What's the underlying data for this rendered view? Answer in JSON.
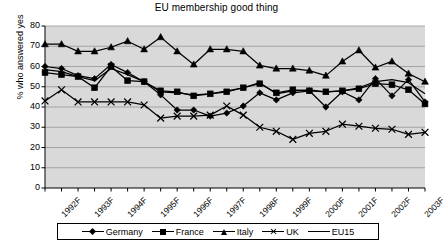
{
  "chart_data": {
    "type": "line",
    "title": "EU membership good thing",
    "xlabel": "",
    "ylabel": "% who answered yes",
    "ylim": [
      0,
      80
    ],
    "ytick_step": 10,
    "yticks": [
      0,
      10,
      20,
      30,
      40,
      50,
      60,
      70,
      80
    ],
    "grid": true,
    "legend_position": "bottom",
    "plot_background": "#d9d9d9",
    "x_tick_labels": [
      "1992F",
      "1993F",
      "1994F",
      "1995F",
      "1996F",
      "1997F",
      "1998F",
      "1999F",
      "2000F",
      "2001F",
      "2002F",
      "2003F"
    ],
    "x_points": 24,
    "x_note": "semi-annual survey waves, labels shown at every second point",
    "series": [
      {
        "name": "Germany",
        "marker": "diamond",
        "color": "#000000",
        "values": [
          60,
          59,
          55.5,
          54,
          61,
          57,
          52.5,
          46,
          38.5,
          38.5,
          35.5,
          37,
          40.5,
          47,
          43.5,
          47,
          48,
          40,
          47.5,
          43.5,
          54,
          45.5,
          53.5,
          42.5
        ]
      },
      {
        "name": "France",
        "marker": "square",
        "color": "#000000",
        "values": [
          57,
          56,
          55,
          49.5,
          60,
          53,
          52.5,
          48,
          47.5,
          45.5,
          46.5,
          47.5,
          49.5,
          51.5,
          47,
          48.5,
          48,
          47.5,
          48,
          49,
          51.5,
          51,
          48.5,
          41.5
        ]
      },
      {
        "name": "Italy",
        "marker": "triangle",
        "color": "#000000",
        "values": [
          71,
          71,
          67.5,
          67.5,
          69.5,
          72.5,
          68.5,
          74.5,
          67.5,
          61,
          68.5,
          68.5,
          67.5,
          60.5,
          59,
          59,
          58,
          55.5,
          62.5,
          68,
          59.5,
          62.5,
          56.5,
          52.5
        ]
      },
      {
        "name": "UK",
        "marker": "cross",
        "color": "#000000",
        "values": [
          43,
          48.5,
          42.5,
          42.5,
          42.5,
          42.5,
          41,
          34.5,
          35.5,
          35.5,
          36,
          40.5,
          36,
          30,
          28,
          24,
          27,
          28,
          31.5,
          30.5,
          29.5,
          29,
          26.5,
          27.5
        ]
      },
      {
        "name": "EU15",
        "marker": "none",
        "color": "#000000",
        "values": [
          58.5,
          57.5,
          55,
          53,
          59,
          56,
          52.5,
          47.5,
          47,
          46,
          46.5,
          48,
          49.5,
          52,
          46.5,
          48,
          48.5,
          47.5,
          48,
          49.5,
          52.5,
          53.5,
          52,
          46.5
        ]
      }
    ]
  },
  "legend": {
    "entries": [
      {
        "label": "Germany",
        "marker": "diamond"
      },
      {
        "label": "France",
        "marker": "square"
      },
      {
        "label": "Italy",
        "marker": "triangle"
      },
      {
        "label": "UK",
        "marker": "cross"
      },
      {
        "label": "EU15",
        "marker": "line"
      }
    ]
  }
}
